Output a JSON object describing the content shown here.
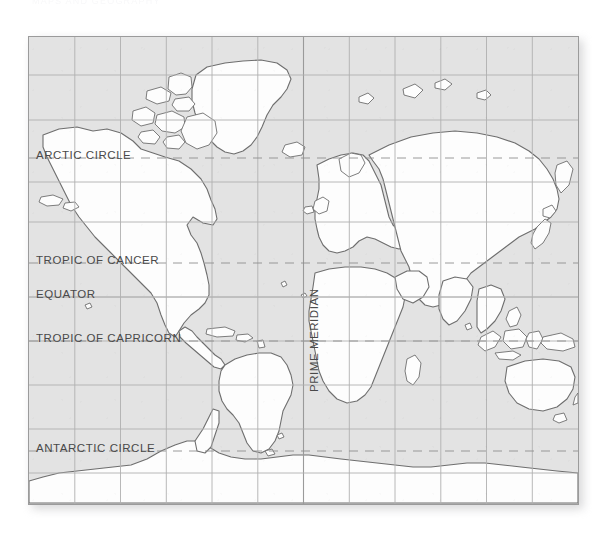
{
  "document": {
    "type": "world-map-figure",
    "top_caption_remnant": "MAPS AND GEOGRAPHY"
  },
  "map": {
    "projection": "Mercator",
    "ocean_color": "#e3e3e3",
    "land_color": "#fdfdfd",
    "coastline_color": "#6e6e6e",
    "grid_color": "#b0b0b0",
    "dashed_line_color": "#8f8f8f",
    "border_color": "#9b9b9b",
    "label_color": "#494949",
    "grid": {
      "visible": true,
      "meridian_interval_degrees": 30,
      "meridian_count": 12,
      "parallel_interval_degrees": 20,
      "parallel_count": 9
    },
    "labels": {
      "arctic_circle": "ARCTIC CIRCLE",
      "tropic_of_cancer": "TROPIC OF CANCER",
      "equator": "EQUATOR",
      "tropic_of_capricorn": "TROPIC OF CAPRICORN",
      "antarctic_circle": "ANTARCTIC CIRCLE",
      "prime_meridian": "PRIME MERIDIAN"
    },
    "reference_lines": [
      {
        "name": "arctic_circle",
        "label": "ARCTIC CIRCLE",
        "latitude": 66.5,
        "style": "dashed",
        "y_px": 157
      },
      {
        "name": "tropic_of_cancer",
        "label": "TROPIC OF CANCER",
        "latitude": 23.5,
        "style": "dashed",
        "y_px": 262
      },
      {
        "name": "equator",
        "label": "EQUATOR",
        "latitude": 0,
        "style": "solid",
        "y_px": 296
      },
      {
        "name": "tropic_of_capricorn",
        "label": "TROPIC OF CAPRICORN",
        "latitude": -23.5,
        "style": "dashed",
        "y_px": 340
      },
      {
        "name": "antarctic_circle",
        "label": "ANTARCTIC CIRCLE",
        "latitude": -66.5,
        "style": "dashed",
        "y_px": 450
      },
      {
        "name": "prime_meridian",
        "label": "PRIME MERIDIAN",
        "longitude": 0,
        "style": "solid",
        "x_px": 303
      }
    ]
  }
}
